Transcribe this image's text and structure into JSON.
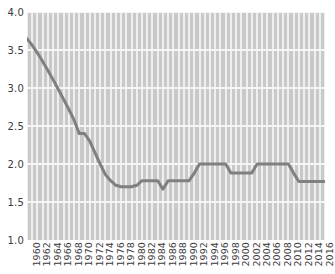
{
  "chart_data": {
    "type": "line",
    "title": "",
    "subtitle": "",
    "xlabel": "",
    "ylabel": "",
    "xlim": [
      1960,
      2017
    ],
    "ylim": [
      1.0,
      4.0
    ],
    "grid": true,
    "legend": false,
    "y_ticks": [
      "1.0",
      "1.5",
      "2.0",
      "2.5",
      "3.0",
      "3.5",
      "4.0"
    ],
    "y_tick_values": [
      1.0,
      1.5,
      2.0,
      2.5,
      3.0,
      3.5,
      4.0
    ],
    "x_ticks": [
      "1960",
      "1962",
      "1964",
      "1966",
      "1968",
      "1970",
      "1972",
      "1974",
      "1976",
      "1978",
      "1980",
      "1982",
      "1984",
      "1986",
      "1988",
      "1990",
      "1992",
      "1994",
      "1996",
      "1998",
      "2000",
      "2002",
      "2004",
      "2006",
      "2008",
      "2010",
      "2012",
      "2014",
      "2016"
    ],
    "x_tick_values": [
      1960,
      1962,
      1964,
      1966,
      1968,
      1970,
      1972,
      1974,
      1976,
      1978,
      1980,
      1982,
      1984,
      1986,
      1988,
      1990,
      1992,
      1994,
      1996,
      1998,
      2000,
      2002,
      2004,
      2006,
      2008,
      2010,
      2012,
      2014,
      2016
    ],
    "x": [
      1960,
      1961,
      1962,
      1963,
      1964,
      1965,
      1966,
      1967,
      1968,
      1969,
      1970,
      1971,
      1972,
      1973,
      1974,
      1975,
      1976,
      1977,
      1978,
      1979,
      1980,
      1981,
      1982,
      1983,
      1984,
      1985,
      1986,
      1987,
      1988,
      1989,
      1990,
      1991,
      1992,
      1993,
      1994,
      1995,
      1996,
      1997,
      1998,
      1999,
      2000,
      2001,
      2002,
      2003,
      2004,
      2005,
      2006,
      2007,
      2008,
      2009,
      2010,
      2011,
      2012,
      2013,
      2014,
      2015,
      2016,
      2017
    ],
    "values": [
      3.65,
      3.56,
      3.46,
      3.35,
      3.23,
      3.11,
      2.98,
      2.85,
      2.72,
      2.58,
      2.4,
      2.4,
      2.3,
      2.15,
      2.0,
      1.86,
      1.78,
      1.72,
      1.7,
      1.7,
      1.7,
      1.72,
      1.78,
      1.78,
      1.78,
      1.78,
      1.67,
      1.78,
      1.78,
      1.78,
      1.78,
      1.78,
      1.88,
      2.0,
      2.0,
      2.0,
      2.0,
      2.0,
      2.0,
      1.88,
      1.88,
      1.88,
      1.88,
      1.88,
      2.0,
      2.0,
      2.0,
      2.0,
      2.0,
      2.0,
      2.0,
      1.88,
      1.77,
      1.77,
      1.77,
      1.77,
      1.77,
      1.77
    ],
    "series": [
      {
        "name": "series-1",
        "color": "#808080",
        "line_width": 3,
        "values": [
          3.65,
          3.56,
          3.46,
          3.35,
          3.23,
          3.11,
          2.98,
          2.85,
          2.72,
          2.58,
          2.4,
          2.4,
          2.3,
          2.15,
          2.0,
          1.86,
          1.78,
          1.72,
          1.7,
          1.7,
          1.7,
          1.72,
          1.78,
          1.78,
          1.78,
          1.78,
          1.67,
          1.78,
          1.78,
          1.78,
          1.78,
          1.78,
          1.88,
          2.0,
          2.0,
          2.0,
          2.0,
          2.0,
          2.0,
          1.88,
          1.88,
          1.88,
          1.88,
          1.88,
          2.0,
          2.0,
          2.0,
          2.0,
          2.0,
          2.0,
          2.0,
          1.88,
          1.77,
          1.77,
          1.77,
          1.77,
          1.77,
          1.77
        ]
      }
    ],
    "colors": {
      "plot_background": "#c9c9c9",
      "stripe": "#efefef",
      "gridline": "#f5f5f5",
      "line": "#808080",
      "tick_label": "#3a3a3a",
      "page_background": "#ffffff"
    }
  }
}
